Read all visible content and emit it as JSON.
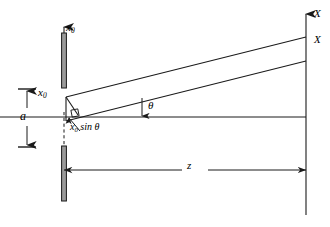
{
  "figure": {
    "background_color": "#ffffff",
    "line_color": "#1a1a1a",
    "width": 330,
    "height": 227
  },
  "labels": {
    "source_axis": {
      "symbol": "x",
      "subscript": "0",
      "name": "x0-axis-label"
    },
    "source_point": {
      "symbol": "x",
      "subscript": "0",
      "name": "x0-source-point-label"
    },
    "aperture_height": {
      "symbol": "a",
      "name": "a-dimension-label"
    },
    "path_difference": {
      "symbol": "x",
      "subscript": "0",
      "operator": "sin",
      "angle": "θ",
      "text": "sin θ"
    },
    "angle": {
      "symbol": "θ",
      "name": "theta-angle-label"
    },
    "distance": {
      "symbol": "z",
      "name": "z-distance-label"
    },
    "screen_axis": {
      "symbol": "X",
      "name": "X-axis-label"
    },
    "screen_point": {
      "symbol": "X",
      "name": "X-observation-point-label"
    }
  },
  "geometry": {
    "source_plane_x": 64,
    "screen_plane_x": 306,
    "optical_axis_y": 117,
    "source_top_y": 88,
    "source_bottom_y": 146,
    "ray_upper_screen_y": 37,
    "ray_lower_screen_y": 61,
    "theta_marker_x": 142,
    "dimension_line_y": 170
  },
  "elements": {
    "source_slit": "vertical-bar-source-aperture",
    "screen": "vertical-screen-axis",
    "rays": [
      "upper-ray",
      "lower-ray"
    ],
    "optical_axis": "horizontal-optical-axis",
    "right_angle_marker": "perpendicular-foot-square",
    "dashed_line": "vertical-dashed-construction-line"
  }
}
